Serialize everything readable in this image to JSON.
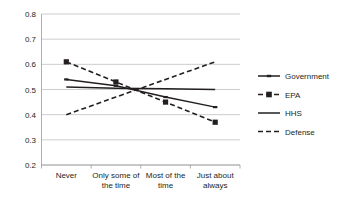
{
  "chart_data": {
    "type": "line",
    "title": "",
    "xlabel": "",
    "ylabel": "",
    "ylim": [
      0.2,
      0.8
    ],
    "yticks": [
      "0.2",
      "0.3",
      "0.4",
      "0.5",
      "0.6",
      "0.7",
      "0.8"
    ],
    "ytick_values": [
      0.2,
      0.3,
      0.4,
      0.5,
      0.6,
      0.7,
      0.8
    ],
    "grid": true,
    "legend_position": "right",
    "categories": [
      "Never",
      "Only some of the time",
      "Most of the time",
      "Just about always"
    ],
    "category_lines": [
      [
        "Never"
      ],
      [
        "Only some of",
        "the time"
      ],
      [
        "Most of the",
        "time"
      ],
      [
        "Just about",
        "always"
      ]
    ],
    "series": [
      {
        "name": "Government",
        "values": [
          0.54,
          0.515,
          0.47,
          0.43
        ],
        "style": "solid",
        "marker": "small-dash",
        "color": "#231f20"
      },
      {
        "name": "EPA",
        "values": [
          0.61,
          0.53,
          0.45,
          0.37
        ],
        "style": "dashed",
        "marker": "square",
        "color": "#231f20"
      },
      {
        "name": "HHS",
        "values": [
          0.51,
          0.505,
          0.503,
          0.5
        ],
        "style": "solid",
        "marker": "none",
        "color": "#231f20"
      },
      {
        "name": "Defense",
        "values": [
          0.4,
          0.47,
          0.54,
          0.61
        ],
        "style": "dashed",
        "marker": "none",
        "color": "#231f20"
      }
    ]
  },
  "legend": {
    "entries": [
      {
        "label": "Government"
      },
      {
        "label": "EPA"
      },
      {
        "label": "HHS"
      },
      {
        "label": "Defense"
      }
    ]
  },
  "colors": {
    "ink": "#231f20",
    "grid": "#b8b8b8",
    "axis": "#9a9a9a",
    "background": "#ffffff"
  }
}
